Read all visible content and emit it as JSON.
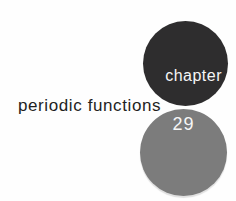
{
  "title": {
    "label": "periodic functions"
  },
  "chapter_badge": {
    "label": "chapter",
    "number": "29"
  },
  "colors": {
    "background": "#fefefe",
    "dark_circle": "#2e2d2e",
    "gray_circle": "#7c7c7c",
    "title_text": "#1f1f1f",
    "badge_text": "#f6f6f6"
  }
}
